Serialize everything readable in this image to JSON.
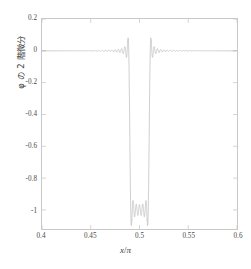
{
  "chart_data": {
    "type": "line",
    "title": "",
    "xlabel": "x/π",
    "ylabel": "φ の 2 階微分",
    "xlim": [
      0.4,
      0.6
    ],
    "ylim": [
      -1.12,
      0.2
    ],
    "xticks": [
      "0.4",
      "0.45",
      "0.5",
      "0.55",
      "0.6"
    ],
    "xtick_values": [
      0.4,
      0.45,
      0.5,
      0.55,
      0.6
    ],
    "yticks": [
      "0.2",
      "0",
      "-0.2",
      "-0.4",
      "-0.6",
      "-0.8",
      "-1"
    ],
    "ytick_values": [
      0.2,
      0,
      -0.2,
      -0.4,
      -0.6,
      -0.8,
      -1
    ],
    "grid": false,
    "legend": null,
    "line_color": "#b9b9b9",
    "frame_color": "#c8c8c8",
    "background": "#ffffff",
    "series": [
      {
        "name": "phi second derivative",
        "well_left_edge": 0.49,
        "well_right_edge": 0.51,
        "well_depth": -1.0,
        "baseline": 0.0,
        "gibbs_overshoot": 0.09,
        "gibbs_ripple_count": 14
      }
    ]
  },
  "axes": {
    "x": {
      "label_math": "x",
      "label_sep": "/",
      "label_denom": "π"
    },
    "y": {
      "label": "φ の 2 階微分"
    }
  }
}
